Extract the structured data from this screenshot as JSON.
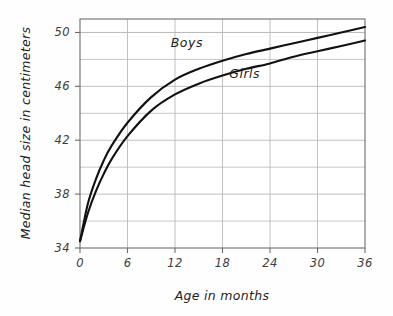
{
  "chart_data": {
    "type": "line",
    "title": "",
    "xlabel": "Age in months",
    "ylabel": "Median head size in centimeters",
    "xlim": [
      0,
      36
    ],
    "ylim": [
      34,
      51
    ],
    "grid": true,
    "legend_position": "inline-curve-labels",
    "x_ticks": [
      "0",
      "6",
      "12",
      "18",
      "24",
      "30",
      "36"
    ],
    "x_tick_values": [
      0,
      6,
      12,
      18,
      24,
      30,
      36
    ],
    "y_ticks": [
      "34",
      "38",
      "42",
      "46",
      "50"
    ],
    "y_tick_values": [
      34,
      38,
      42,
      46,
      50
    ],
    "y_minor_gridlines": [
      36,
      40,
      44,
      48,
      50
    ],
    "x": [
      0,
      1,
      2,
      3,
      4,
      6,
      9,
      12,
      15,
      18,
      21,
      24,
      27,
      30,
      33,
      36
    ],
    "series": [
      {
        "name": "Boys",
        "color": "#111111",
        "label_position": {
          "x": 13.5,
          "y": 48.9
        },
        "values": [
          34.5,
          37.3,
          39.1,
          40.5,
          41.6,
          43.3,
          45.2,
          46.5,
          47.3,
          47.9,
          48.4,
          48.8,
          49.2,
          49.6,
          50.0,
          50.4
        ]
      },
      {
        "name": "Girls",
        "color": "#111111",
        "label_position": {
          "x": 20.8,
          "y": 46.6
        },
        "values": [
          34.5,
          36.6,
          38.2,
          39.5,
          40.6,
          42.3,
          44.2,
          45.4,
          46.2,
          46.8,
          47.3,
          47.7,
          48.2,
          48.6,
          49.0,
          49.4
        ]
      }
    ],
    "colors": {
      "background": "#fefefe",
      "plot_background": "#ffffff",
      "grid": "#b9b9b9",
      "axis": "#6d6d6d",
      "curve": "#111111",
      "tick_label": "#3d3d3d",
      "axis_title": "#1f1f1f"
    }
  }
}
